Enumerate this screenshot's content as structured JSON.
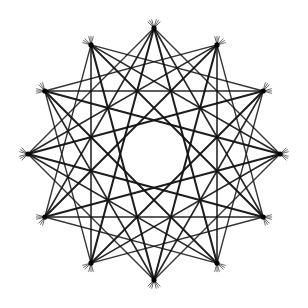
{
  "figure": {
    "type": "star-polygon-construction",
    "center": [
      154,
      154
    ],
    "radius": 126,
    "vertex_count": 12,
    "start_angle_deg": -90,
    "step_families": [
      {
        "step": 3,
        "stroke_width": 1.4,
        "opacity": 0.85
      },
      {
        "step": 4,
        "stroke_width": 1.6,
        "opacity": 0.9
      },
      {
        "step": 5,
        "stroke_width": 2.0,
        "opacity": 0.95
      }
    ],
    "colors": {
      "background": "#ffffff",
      "stroke": "#111111",
      "vertex": "#000000"
    },
    "vertex_dot_radius": 2.6,
    "tick_length": 9
  }
}
